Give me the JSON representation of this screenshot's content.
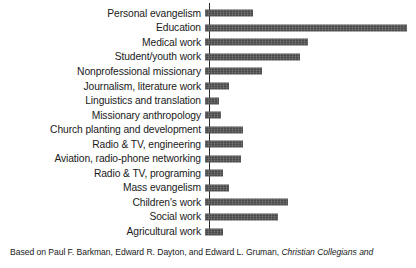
{
  "chart_data": {
    "type": "bar",
    "orientation": "horizontal",
    "title": "",
    "subtitle": "",
    "xlabel": "",
    "ylabel": "",
    "grid": false,
    "legend": null,
    "axis": {
      "category_axis": "vertical-left",
      "value_axis_labels_shown": false,
      "xlim": [
        0,
        100
      ]
    },
    "categories": [
      "Personal evangelism",
      "Education",
      "Medical work",
      "Student/youth work",
      "Nonprofessional missionary",
      "Journalism, literature work",
      "Linguistics and translation",
      "Missionary anthropology",
      "Church planting and development",
      "Radio & TV, engineering",
      "Aviation, radio-phone networking",
      "Radio & TV, programing",
      "Mass evangelism",
      "Children's work",
      "Social work",
      "Agricultural work"
    ],
    "values": [
      24,
      100,
      51,
      47,
      28,
      12,
      7,
      8,
      19,
      19,
      18,
      9,
      12,
      41,
      36,
      9
    ],
    "value_unit": "relative length (percent of longest bar)"
  },
  "caption": {
    "lead": "Based on Paul F. Barkman, Edward R. Dayton, and Edward L. Gruman, ",
    "title": "Christian Collegians and",
    "trailing": ""
  },
  "style": {
    "bar_color": "#4a4a4a",
    "axis_color": "#2b2b2b",
    "text_color": "#1a1a1a",
    "background": "#ffffff"
  }
}
